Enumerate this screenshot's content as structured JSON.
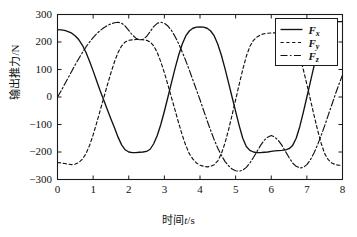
{
  "chart_data": {
    "type": "line",
    "title": "",
    "xlabel": "时间t/s",
    "ylabel": "输出推力/N",
    "xlim": [
      0,
      8
    ],
    "ylim": [
      -300,
      300
    ],
    "xticks": [
      "0",
      "1",
      "2",
      "3",
      "4",
      "5",
      "6",
      "7",
      "8"
    ],
    "yticks": [
      "300",
      "200",
      "100",
      "0",
      "-100",
      "-200",
      "-300"
    ],
    "grid": false,
    "legend_position": "top-right",
    "legend": [
      {
        "label": "F",
        "sub": "x",
        "style": "solid"
      },
      {
        "label": "F",
        "sub": "y",
        "style": "dashed"
      },
      {
        "label": "F",
        "sub": "z",
        "style": "dashdot"
      }
    ],
    "x": [
      0,
      0.1,
      0.2,
      0.3,
      0.4,
      0.5,
      0.6,
      0.7,
      0.8,
      0.9,
      1.0,
      1.1,
      1.2,
      1.3,
      1.4,
      1.5,
      1.6,
      1.7,
      1.8,
      1.9,
      2.0,
      2.1,
      2.2,
      2.3,
      2.4,
      2.5,
      2.6,
      2.7,
      2.8,
      2.9,
      3.0,
      3.1,
      3.2,
      3.3,
      3.4,
      3.5,
      3.6,
      3.7,
      3.8,
      3.9,
      4.0,
      4.1,
      4.2,
      4.3,
      4.4,
      4.5,
      4.6,
      4.7,
      4.8,
      4.9,
      5.0,
      5.1,
      5.2,
      5.3,
      5.4,
      5.5,
      5.6,
      5.7,
      5.8,
      5.9,
      6.0,
      6.1,
      6.2,
      6.3,
      6.4,
      6.5,
      6.6,
      6.7,
      6.8,
      6.9,
      7.0,
      7.1,
      7.2,
      7.3,
      7.4,
      7.5,
      7.6,
      7.7,
      7.8,
      7.9,
      8.0
    ],
    "series": [
      {
        "name": "Fx",
        "style": "solid",
        "values": [
          245,
          244,
          242,
          238,
          232,
          222,
          208,
          188,
          162,
          130,
          95,
          58,
          22,
          -12,
          -46,
          -80,
          -112,
          -146,
          -174,
          -192,
          -200,
          -202,
          -202,
          -201,
          -200,
          -198,
          -190,
          -170,
          -140,
          -100,
          -52,
          0,
          52,
          104,
          152,
          192,
          222,
          240,
          250,
          254,
          255,
          254,
          250,
          240,
          222,
          192,
          152,
          104,
          52,
          0,
          -52,
          -104,
          -150,
          -180,
          -194,
          -200,
          -202,
          -202,
          -201,
          -200,
          -198,
          -196,
          -195,
          -194,
          -192,
          -188,
          -176,
          -150,
          -108,
          -56,
          0,
          56,
          112,
          164,
          208,
          240,
          258,
          268,
          272,
          274,
          274
        ]
      },
      {
        "name": "Fy",
        "style": "dashed",
        "values": [
          -238,
          -240,
          -242,
          -244,
          -246,
          -244,
          -238,
          -226,
          -206,
          -176,
          -138,
          -94,
          -48,
          -2,
          44,
          88,
          128,
          162,
          186,
          200,
          206,
          208,
          209,
          209,
          208,
          206,
          200,
          186,
          162,
          128,
          88,
          44,
          -2,
          -48,
          -94,
          -138,
          -176,
          -206,
          -226,
          -240,
          -248,
          -252,
          -254,
          -252,
          -246,
          -232,
          -206,
          -168,
          -120,
          -66,
          -10,
          46,
          100,
          148,
          184,
          206,
          218,
          226,
          230,
          232,
          233,
          233,
          232,
          230,
          226,
          218,
          206,
          184,
          148,
          100,
          46,
          -10,
          -66,
          -120,
          -168,
          -206,
          -228,
          -240,
          -246,
          -248,
          -248
        ]
      },
      {
        "name": "Fz",
        "style": "dashdot",
        "values": [
          0,
          22,
          46,
          70,
          94,
          118,
          140,
          162,
          182,
          200,
          216,
          230,
          242,
          252,
          260,
          266,
          270,
          272,
          268,
          258,
          242,
          226,
          214,
          208,
          210,
          220,
          238,
          256,
          268,
          272,
          268,
          258,
          242,
          220,
          194,
          164,
          132,
          98,
          62,
          26,
          -10,
          -48,
          -86,
          -122,
          -156,
          -186,
          -212,
          -234,
          -250,
          -262,
          -268,
          -270,
          -266,
          -256,
          -240,
          -220,
          -198,
          -176,
          -158,
          -146,
          -140,
          -146,
          -158,
          -176,
          -198,
          -220,
          -240,
          -252,
          -258,
          -256,
          -246,
          -228,
          -204,
          -174,
          -140,
          -104,
          -66,
          -28,
          10,
          46,
          80
        ]
      }
    ]
  }
}
